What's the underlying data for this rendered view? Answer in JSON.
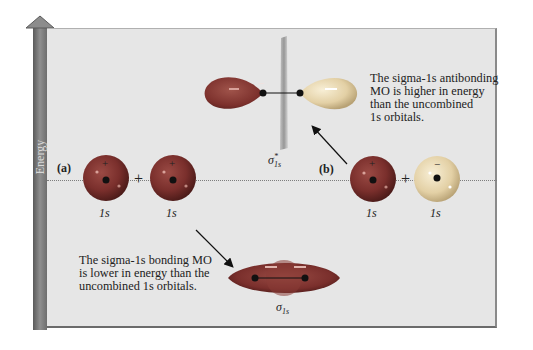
{
  "axis": {
    "label": "Energy"
  },
  "panel_a": {
    "tag": "(a)",
    "orbital_left_label": "1s",
    "orbital_right_label": "1s",
    "left_sign": "+",
    "right_sign": "+",
    "operator": "+"
  },
  "panel_b": {
    "tag": "(b)",
    "orbital_left_label": "1s",
    "orbital_right_label": "1s",
    "left_sign": "+",
    "right_sign": "−",
    "operator": "+"
  },
  "antibonding": {
    "symbol": "σ",
    "superscript": "*",
    "subscript": "1s",
    "description_lines": [
      "The sigma-1s antibonding",
      "MO is higher in energy",
      "than the uncombined",
      "1s orbitals."
    ]
  },
  "bonding": {
    "symbol": "σ",
    "subscript": "1s",
    "description_lines": [
      "The sigma-1s bonding MO",
      "is lower in energy than the",
      "uncombined 1s orbitals."
    ]
  },
  "colors": {
    "panel_bg": "#e6e6e6",
    "orbital_dark": "#7a2f2c",
    "orbital_light": "#e9d9b4",
    "energy_bar": "#7a7a7a"
  }
}
